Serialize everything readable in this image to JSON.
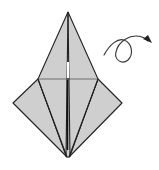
{
  "diagram": {
    "type": "origami-step",
    "description": "Origami model (bird base variant) viewed flat with kite-shaped lower section and narrow upper point; a turn-over arrow indicates flipping the model.",
    "colors": {
      "paper_fill": "#cfcfcf",
      "outline": "#222222",
      "crease": "#333333",
      "highlight": "#ffffff",
      "arrow": "#333333"
    },
    "shape": {
      "top_apex": [
        68,
        12
      ],
      "left_point": [
        13,
        103
      ],
      "right_point": [
        122,
        103
      ],
      "bottom_apex": [
        68,
        157
      ],
      "shoulder_left": [
        38,
        79
      ],
      "shoulder_right": [
        98,
        79
      ]
    },
    "symbols": [
      {
        "name": "turn-over-arrow",
        "meaning": "Turn the model over"
      }
    ]
  }
}
